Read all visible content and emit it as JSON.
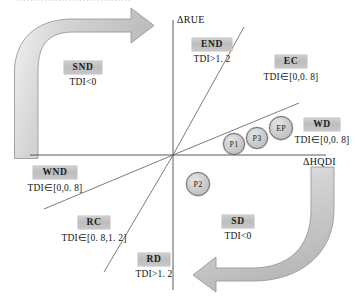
{
  "figure": {
    "top_cut_text": "·································",
    "axes": {
      "y_label": "ΔRUE",
      "x_label": "ΔHQDI"
    },
    "quadrant_labels": [
      {
        "key": "SND",
        "name": "SND",
        "condition": "TDI<0"
      },
      {
        "key": "END",
        "name": "END",
        "condition": "TDI>1. 2"
      },
      {
        "key": "EC",
        "name": "EC",
        "condition": "TDI∈[0. 8,1. 2]"
      },
      {
        "key": "WD",
        "name": "WD",
        "condition": "TDI∈[0,0. 8]"
      },
      {
        "key": "WND",
        "name": "WND",
        "condition": "TDI∈[0,0. 8]"
      },
      {
        "key": "RC",
        "name": "RC",
        "condition": "TDI∈[0. 8,1. 2]"
      },
      {
        "key": "RD",
        "name": "RD",
        "condition": "TDI>1. 2"
      },
      {
        "key": "SD",
        "name": "SD",
        "condition": "TDI<0"
      }
    ],
    "points": [
      {
        "key": "P1",
        "label": "P1"
      },
      {
        "key": "P3",
        "label": "P3"
      },
      {
        "key": "EP",
        "label": "EP"
      },
      {
        "key": "P2",
        "label": "P2"
      }
    ],
    "arrows": [
      {
        "key": "left-arrow",
        "direction": "clockwise-up-right"
      },
      {
        "key": "right-arrow",
        "direction": "clockwise-down-left"
      }
    ],
    "colors": {
      "badge_fill": "#c4c4c4",
      "arrow_fill": "#cdcdcd",
      "arrow_stroke": "#8e8e8e",
      "node_fill": "#cfcfcf",
      "node_stroke": "#6b6b6b",
      "line": "#4a4a4a",
      "background": "#ffffff"
    }
  }
}
